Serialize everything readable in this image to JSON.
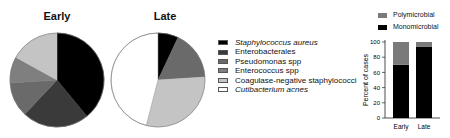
{
  "pies": [
    {
      "title": "Early"
    },
    {
      "title": "Late"
    }
  ],
  "legend": {
    "items": [
      {
        "label": "Staphylococcus aureus",
        "color": "#000000",
        "italic": true
      },
      {
        "label": "Enterobacterales",
        "color": "#3a3a3a",
        "italic": false
      },
      {
        "label": "Pseudomonas spp",
        "color": "#6a6a6a",
        "italic": false
      },
      {
        "label": "Enterococcus spp",
        "color": "#7f7f7f",
        "italic": false
      },
      {
        "label": "Coagulase-negative staphylococci",
        "color": "#c4c4c4",
        "italic": false
      },
      {
        "label": "Cutibacterium acnes",
        "color": "#ffffff",
        "italic": true
      }
    ]
  },
  "bar_legend": {
    "items": [
      {
        "label": "Polymicrobial",
        "color": "#7a7a7a"
      },
      {
        "label": "Monomicrobial",
        "color": "#000000"
      }
    ]
  },
  "bar_axis": {
    "ylabel": "Percent of cases",
    "ticks": [
      "0",
      "20",
      "40",
      "60",
      "80",
      "100"
    ],
    "categories": [
      "Early",
      "Late"
    ]
  },
  "chart_data": [
    {
      "type": "pie",
      "title": "Early",
      "categories": [
        "Staphylococcus aureus",
        "Enterobacterales",
        "Pseudomonas spp",
        "Enterococcus spp",
        "Coagulase-negative staphylococci",
        "Cutibacterium acnes"
      ],
      "values": [
        39,
        23,
        12,
        9,
        17,
        0
      ],
      "colors": [
        "#000000",
        "#3a3a3a",
        "#6a6a6a",
        "#7f7f7f",
        "#c4c4c4",
        "#ffffff"
      ]
    },
    {
      "type": "pie",
      "title": "Late",
      "categories": [
        "Staphylococcus aureus",
        "Enterobacterales",
        "Pseudomonas spp",
        "Enterococcus spp",
        "Coagulase-negative staphylococci",
        "Cutibacterium acnes"
      ],
      "values": [
        7,
        0,
        17,
        0,
        30,
        46
      ],
      "colors": [
        "#000000",
        "#3a3a3a",
        "#6a6a6a",
        "#7f7f7f",
        "#c4c4c4",
        "#ffffff"
      ]
    },
    {
      "type": "bar",
      "stacked": true,
      "categories": [
        "Early",
        "Late"
      ],
      "series": [
        {
          "name": "Monomicrobial",
          "values": [
            70,
            94
          ],
          "color": "#000000"
        },
        {
          "name": "Polymicrobial",
          "values": [
            30,
            6
          ],
          "color": "#7a7a7a"
        }
      ],
      "xlabel": "",
      "ylabel": "Percent of cases",
      "ylim": [
        0,
        100
      ],
      "yticks": [
        0,
        20,
        40,
        60,
        80,
        100
      ],
      "legend_position": "top"
    }
  ]
}
